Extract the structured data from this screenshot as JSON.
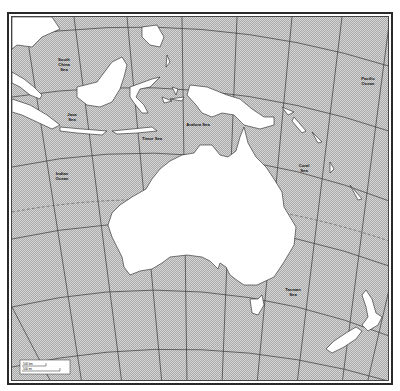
{
  "map": {
    "title": "Australia and Oceania outline map",
    "colors": {
      "ocean_hatch": "#bdbdbd",
      "ocean_base": "#dcdcdc",
      "land": "#ffffff",
      "graticule": "#3a3a3a",
      "border": "#2a2a2a"
    },
    "labels": {
      "south_china_sea": [
        "South",
        "China",
        "Sea"
      ],
      "java_sea": [
        "Java",
        "Sea"
      ],
      "arafura_sea": [
        "Arafura Sea"
      ],
      "timor_sea": [
        "Timor Sea"
      ],
      "indian_ocean": [
        "Indian",
        "Ocean"
      ],
      "coral_sea": [
        "Coral",
        "Sea"
      ],
      "pacific_ocean": [
        "Pacific",
        "Ocean"
      ],
      "tasman_sea": [
        "Tasman",
        "Sea"
      ]
    },
    "scale_bar": {
      "top_label": "500 km",
      "bottom_label": "500 mi"
    }
  }
}
